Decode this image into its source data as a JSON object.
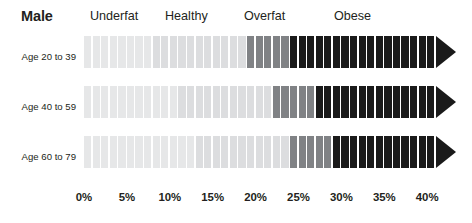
{
  "header": {
    "title": "Male",
    "categories": [
      {
        "label": "Underfat",
        "x": 90
      },
      {
        "label": "Healthy",
        "x": 165
      },
      {
        "label": "Overfat",
        "x": 244
      },
      {
        "label": "Obese",
        "x": 334
      }
    ]
  },
  "colors": {
    "underfat": "#e6e7e8",
    "healthy": "#dcdddf",
    "overfat": "#808285",
    "obese": "#1a1a1a",
    "gap": "#ffffff",
    "text": "#231f20",
    "background": "#ffffff"
  },
  "chart_data": {
    "type": "bar",
    "title": "Male",
    "xlabel": "",
    "ylabel": "",
    "xlim": [
      0,
      42
    ],
    "grid": false,
    "legend_position": "top",
    "legend": [
      "Underfat",
      "Healthy",
      "Overfat",
      "Obese"
    ],
    "tick_labels": [
      "0%",
      "5%",
      "10%",
      "15%",
      "20%",
      "25%",
      "30%",
      "35%",
      "40%"
    ],
    "tick_values": [
      0,
      5,
      10,
      15,
      20,
      25,
      30,
      35,
      40
    ],
    "categories": [
      "Age 20 to 39",
      "Age 40 to 59",
      "Age 60 to 79"
    ],
    "series": [
      {
        "name": "Age 20 to 39",
        "underfat_max": 8,
        "healthy_range": [
          8,
          19
        ],
        "overfat_range": [
          19,
          24
        ],
        "obese_min": 24,
        "bar_end": 41
      },
      {
        "name": "Age 40 to 59",
        "underfat_max": 11,
        "healthy_range": [
          11,
          22
        ],
        "overfat_range": [
          22,
          27
        ],
        "obese_min": 27,
        "bar_end": 41
      },
      {
        "name": "Age 60 to 79",
        "underfat_max": 13,
        "healthy_range": [
          13,
          24
        ],
        "overfat_range": [
          24,
          29
        ],
        "obese_min": 29,
        "bar_end": 41
      }
    ]
  },
  "geometry": {
    "x0": 84.0,
    "px_per_pct": 8.58,
    "bar_height": 32,
    "row_tops": [
      36,
      86,
      136
    ],
    "label_tops": [
      51,
      101,
      151
    ],
    "arrow_width": 20
  },
  "axis": {
    "ticks": [
      {
        "label": "0%",
        "value": 0
      },
      {
        "label": "5%",
        "value": 5
      },
      {
        "label": "10%",
        "value": 10
      },
      {
        "label": "15%",
        "value": 15
      },
      {
        "label": "20%",
        "value": 20
      },
      {
        "label": "25%",
        "value": 25
      },
      {
        "label": "30%",
        "value": 30
      },
      {
        "label": "35%",
        "value": 35
      },
      {
        "label": "40%",
        "value": 40
      }
    ]
  }
}
